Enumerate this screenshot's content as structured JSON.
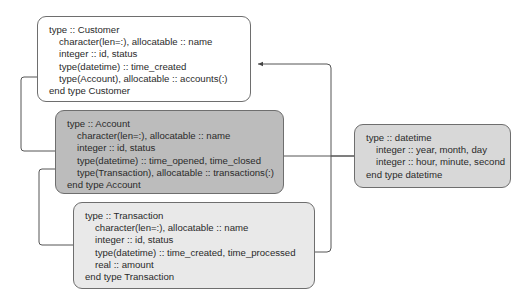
{
  "diagram": {
    "types": {
      "customer": {
        "header": "type :: Customer",
        "fields": [
          "character(len=:), allocatable :: name",
          "integer :: id, status",
          "type(datetime) :: time_created",
          "type(Account), allocatable :: accounts(:)"
        ],
        "footer": "end type Customer",
        "fill": "#ffffff"
      },
      "account": {
        "header": "type :: Account",
        "fields": [
          "character(len=:), allocatable :: name",
          "integer :: id, status",
          "type(datetime) :: time_opened, time_closed",
          "type(Transaction), allocatable :: transactions(:)"
        ],
        "footer": "end type Account",
        "fill": "#bcbcbc"
      },
      "transaction": {
        "header": "type :: Transaction",
        "fields": [
          "character(len=:), allocatable :: name",
          "integer :: id, status",
          "type(datetime) :: time_created, time_processed",
          "real :: amount"
        ],
        "footer": "end type Transaction",
        "fill": "#e9e9e9"
      },
      "datetime": {
        "header": "type :: datetime",
        "fields": [
          "integer :: year, month, day",
          "integer :: hour, minute, second"
        ],
        "footer": "end type datetime",
        "fill": "#d8d8d8"
      }
    },
    "connections": [
      {
        "from": "datetime",
        "to": "customer.time_created"
      },
      {
        "from": "datetime",
        "to": "account.time_opened_time_closed"
      },
      {
        "from": "datetime",
        "to": "transaction.time_created_time_processed"
      },
      {
        "from": "account",
        "to": "customer.accounts"
      },
      {
        "from": "transaction",
        "to": "account.transactions"
      }
    ],
    "line_color": "#555555"
  }
}
